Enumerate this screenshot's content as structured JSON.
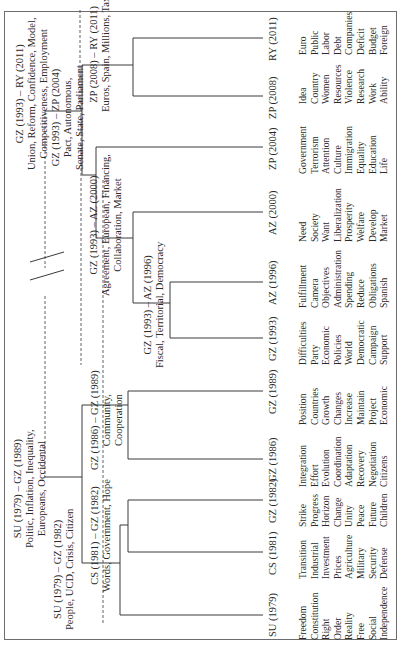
{
  "figure": {
    "type": "dendrogram",
    "orientation": "rotated-90-ccw",
    "leaves": [
      {
        "id": "SU1979",
        "label": "SU (1979)",
        "words": [
          "Freedom",
          "Constitution",
          "Right",
          "Order",
          "Reality",
          "Free",
          "Social",
          "Independence"
        ]
      },
      {
        "id": "CS1981",
        "label": "CS (1981)",
        "words": [
          "Transition",
          "Industrial",
          "Investment",
          "Prices",
          "Agriculture",
          "Military",
          "Security",
          "Defense"
        ]
      },
      {
        "id": "GZ1982",
        "label": "GZ (1982)",
        "words": [
          "Strike",
          "Progress",
          "Horizon",
          "Change",
          "Unity",
          "Peace",
          "Future",
          "Children"
        ]
      },
      {
        "id": "GZ1986",
        "label": "GZ (1986)",
        "words": [
          "Integration",
          "Effort",
          "Evolution",
          "Coordination",
          "Adaptation",
          "Recovery",
          "Negotiation",
          "Citizens"
        ]
      },
      {
        "id": "GZ1989",
        "label": "GZ (1989)",
        "words": [
          "Position",
          "Countries",
          "Growth",
          "Changes",
          "Increase",
          "Maintain",
          "Project",
          "Economic"
        ]
      },
      {
        "id": "GZ1993",
        "label": "GZ (1993)",
        "words": [
          "Difficulties",
          "Party",
          "Economic",
          "Policies",
          "World",
          "Democratic",
          "Campaign",
          "Support"
        ]
      },
      {
        "id": "AZ1996",
        "label": "AZ (1996)",
        "words": [
          "Fulfillment",
          "Camera",
          "Objectives",
          "Administration",
          "Spending",
          "Reduce",
          "Obligations",
          "Spanish"
        ]
      },
      {
        "id": "AZ2000",
        "label": "AZ (2000)",
        "words": [
          "Need",
          "Society",
          "Want",
          "Liberalization",
          "Prosperity",
          "Welfare",
          "Develop",
          "Market"
        ]
      },
      {
        "id": "ZP2004",
        "label": "ZP (2004)",
        "words": [
          "Government",
          "Terrorism",
          "Attention",
          "Culture",
          "Immigration",
          "Equality",
          "Education",
          "Life"
        ]
      },
      {
        "id": "ZP2008",
        "label": "ZP (2008)",
        "words": [
          "Idea",
          "Country",
          "Women",
          "Resources",
          "Violence",
          "Research",
          "Work",
          "Ability"
        ]
      },
      {
        "id": "RY2011",
        "label": "RY (2011)",
        "words": [
          "Euro",
          "Public",
          "Labor",
          "Debt",
          "Companies",
          "Deficit",
          "Budget",
          "Foreign"
        ]
      }
    ],
    "clusters": [
      {
        "id": "n1",
        "title": "SU (1979) – GZ (1989)",
        "words": [
          "Politic, Inflation, Inequality,",
          "Europeans, Occidental"
        ]
      },
      {
        "id": "n2",
        "title": "SU (1979) – GZ (1982)",
        "words": [
          "People, UCD, Crisis, Citizen"
        ]
      },
      {
        "id": "n3",
        "title": "CS (1981) – GZ (1982)",
        "words": [
          "Words, Government, Hope"
        ]
      },
      {
        "id": "n4",
        "title": "GZ (1986) – GZ (1989)",
        "words": [
          "Community,",
          "Cooperation"
        ]
      },
      {
        "id": "n5",
        "title": "GZ (1993) – RY (2011)",
        "words": [
          "Union, Reform, Confidence, Model,",
          "Competitiveness, Employment"
        ]
      },
      {
        "id": "n6",
        "title": "GZ (1993) – ZP (2004)",
        "words": [
          "Pact, Autonomous,",
          "Senate, State, Parliament"
        ]
      },
      {
        "id": "n7",
        "title": "ZP (2008) – RY (2011)",
        "words": [
          "Euros, Spain, Millions, Tax"
        ]
      },
      {
        "id": "n8",
        "title": "GZ (1993) – AZ (2000)",
        "words": [
          "Agreement, European, Financing,",
          "Collaboration, Market"
        ]
      },
      {
        "id": "n9",
        "title": "GZ (1993) – AZ (1996)",
        "words": [
          "Fiscal, Territorial, Democracy"
        ]
      }
    ],
    "colors": {
      "line": "#3a3a3a",
      "frame": "#6d6d6d",
      "text": "#2a2a2a"
    }
  }
}
